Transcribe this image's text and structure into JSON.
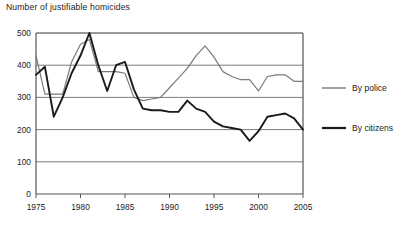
{
  "chart_data": {
    "type": "line",
    "title": "Number of justifiable homicides",
    "xlabel": "",
    "ylabel": "",
    "xlim": [
      1975,
      2005
    ],
    "ylim": [
      0,
      500
    ],
    "xticks": [
      1975,
      1980,
      1985,
      1990,
      1995,
      2000,
      2005
    ],
    "yticks": [
      0,
      100,
      200,
      300,
      400,
      500
    ],
    "grid": true,
    "grid_axis": "y",
    "legend_position": "right",
    "x": [
      1975,
      1976,
      1977,
      1978,
      1979,
      1980,
      1981,
      1982,
      1983,
      1984,
      1985,
      1986,
      1987,
      1988,
      1989,
      1990,
      1991,
      1992,
      1993,
      1994,
      1995,
      1996,
      1997,
      1998,
      1999,
      2000,
      2001,
      2002,
      2003,
      2004,
      2005
    ],
    "series": [
      {
        "name": "By police",
        "color": "#7a7a7a",
        "values": [
          430,
          310,
          310,
          310,
          410,
          465,
          480,
          380,
          380,
          380,
          375,
          300,
          290,
          295,
          300,
          330,
          360,
          390,
          430,
          460,
          425,
          380,
          365,
          355,
          355,
          320,
          365,
          370,
          370,
          350,
          350
        ]
      },
      {
        "name": "By citizens",
        "color": "#1a1a1a",
        "values": [
          370,
          395,
          240,
          300,
          375,
          430,
          500,
          400,
          320,
          400,
          410,
          325,
          265,
          260,
          260,
          255,
          255,
          290,
          265,
          255,
          225,
          210,
          205,
          200,
          165,
          195,
          240,
          245,
          250,
          235,
          200
        ]
      }
    ],
    "annotations": []
  },
  "legend": {
    "items": [
      {
        "label": "By police",
        "color": "#7a7a7a",
        "width": 1.4
      },
      {
        "label": "By citizens",
        "color": "#1a1a1a",
        "width": 2.2
      }
    ]
  },
  "axis": {
    "x_tick_labels": [
      "1975",
      "1980",
      "1985",
      "1990",
      "1995",
      "2000",
      "2005"
    ],
    "y_tick_labels": [
      "0",
      "100",
      "200",
      "300",
      "400",
      "500"
    ]
  }
}
